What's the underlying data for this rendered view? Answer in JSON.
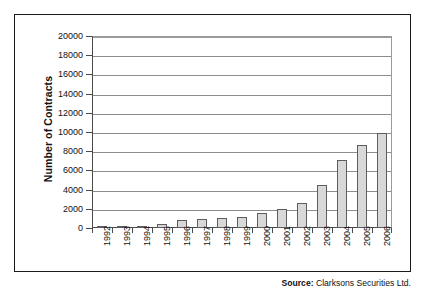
{
  "chart_data": {
    "type": "bar",
    "title": "",
    "xlabel": "",
    "ylabel": "Number of Contracts",
    "categories": [
      "1992",
      "1993",
      "1994",
      "1995",
      "1996",
      "1997",
      "1998",
      "1999",
      "2000",
      "2001",
      "2002",
      "2003",
      "2004",
      "2005",
      "2006"
    ],
    "values": [
      100,
      200,
      220,
      450,
      800,
      900,
      1000,
      1150,
      1550,
      2000,
      2600,
      4500,
      7050,
      8600,
      9900
    ],
    "ylim": [
      0,
      20000
    ],
    "ytick_step": 2000,
    "yticks": [
      "20000",
      "18000",
      "16000",
      "14000",
      "12000",
      "10000",
      "8000",
      "6000",
      "4000",
      "2000",
      "0"
    ],
    "grid": true,
    "legend": "none",
    "bar_fill_color": "#d8d8d8",
    "bar_border_color": "#5d5d5d",
    "axis_color": "#4a4a4a",
    "gridline_color": "#8c8c8c"
  },
  "source": {
    "label": "Source:",
    "text": "Clarksons Securities Ltd."
  }
}
